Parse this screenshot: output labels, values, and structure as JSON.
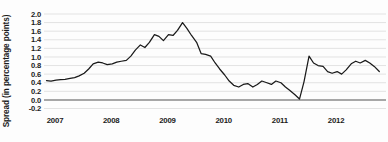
{
  "chart_data": {
    "type": "line",
    "title": "",
    "subtitle": "",
    "xlabel": "",
    "ylabel": "Spread (in percentage points)",
    "grid": true,
    "legend": "none",
    "xlim": [
      2007.0,
      2012.95
    ],
    "ylim": [
      -0.2,
      2.0
    ],
    "yticks": [
      2.0,
      1.8,
      1.6,
      1.4,
      1.2,
      1.0,
      0.8,
      0.6,
      0.4,
      0.2,
      0.0,
      -0.2
    ],
    "ytick_labels": [
      "2.0",
      "1.8",
      "1.6",
      "1.4",
      "1.2",
      "1.0",
      "0.8",
      "0.6",
      "0.4",
      "0.2",
      "0.0",
      "-0.2"
    ],
    "xticks": [
      2007,
      2008,
      2009,
      2010,
      2011,
      2012
    ],
    "xtick_labels": [
      "2007",
      "2008",
      "2009",
      "2010",
      "2011",
      "2012"
    ],
    "zero_reference_line": 0.0,
    "series": [
      {
        "name": "Spread",
        "color": "#1a1a1a",
        "x": [
          2007.0,
          2007.08,
          2007.17,
          2007.25,
          2007.33,
          2007.42,
          2007.5,
          2007.58,
          2007.67,
          2007.75,
          2007.83,
          2007.92,
          2008.0,
          2008.08,
          2008.17,
          2008.25,
          2008.33,
          2008.42,
          2008.5,
          2008.58,
          2008.67,
          2008.75,
          2008.83,
          2008.92,
          2009.0,
          2009.08,
          2009.17,
          2009.25,
          2009.33,
          2009.42,
          2009.5,
          2009.58,
          2009.67,
          2009.75,
          2009.83,
          2009.92,
          2010.0,
          2010.08,
          2010.17,
          2010.25,
          2010.33,
          2010.42,
          2010.5,
          2010.58,
          2010.67,
          2010.75,
          2010.83,
          2010.92,
          2011.0,
          2011.08,
          2011.17,
          2011.25,
          2011.33,
          2011.42,
          2011.5,
          2011.58,
          2011.67,
          2011.75,
          2011.83,
          2011.92,
          2012.0,
          2012.08,
          2012.17,
          2012.25,
          2012.33,
          2012.42,
          2012.5,
          2012.58,
          2012.67,
          2012.75,
          2012.83,
          2012.92
        ],
        "values": [
          0.45,
          0.44,
          0.46,
          0.47,
          0.48,
          0.5,
          0.52,
          0.56,
          0.62,
          0.72,
          0.84,
          0.88,
          0.86,
          0.82,
          0.84,
          0.88,
          0.9,
          0.92,
          1.02,
          1.16,
          1.28,
          1.22,
          1.34,
          1.52,
          1.48,
          1.38,
          1.52,
          1.5,
          1.62,
          1.8,
          1.66,
          1.5,
          1.34,
          1.08,
          1.06,
          1.02,
          0.86,
          0.72,
          0.58,
          0.44,
          0.34,
          0.3,
          0.36,
          0.38,
          0.3,
          0.36,
          0.44,
          0.4,
          0.36,
          0.44,
          0.4,
          0.3,
          0.22,
          0.12,
          0.02,
          0.42,
          1.02,
          0.86,
          0.8,
          0.78,
          0.66,
          0.62,
          0.66,
          0.6,
          0.7,
          0.84,
          0.9,
          0.86,
          0.92,
          0.86,
          0.78,
          0.66
        ]
      }
    ],
    "annotations": []
  },
  "axis": {
    "y_label": "Spread (in percentage points)"
  }
}
